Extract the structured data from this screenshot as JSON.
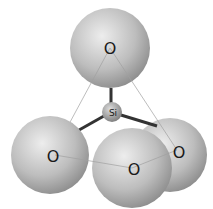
{
  "diagram": {
    "atoms": {
      "top_oxygen": "O",
      "silicon": "Si",
      "left_oxygen": "O",
      "front_oxygen": "O",
      "right_oxygen": "O"
    },
    "colors": {
      "oxygen_light": "#e6e6e6",
      "oxygen_dark": "#8a8a8a",
      "bond": "#333333",
      "outline": "#999999"
    }
  }
}
